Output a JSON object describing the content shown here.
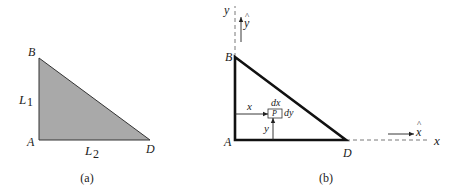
{
  "figure_a": {
    "caption": "(a)",
    "vertices": {
      "B": "B",
      "A": "A",
      "D": "D"
    },
    "side_labels": {
      "L1_main": "L",
      "L1_sub": "1",
      "L2_main": "L",
      "L2_sub": "2"
    },
    "fill_color": "#a9a9a9"
  },
  "figure_b": {
    "caption": "(b)",
    "vertices": {
      "B": "B",
      "A": "A",
      "D": "D"
    },
    "axes": {
      "y": "y",
      "x": "x",
      "y_hat": "y",
      "x_hat": "x",
      "hat": "^"
    },
    "element": {
      "point": "P",
      "dx": "dx",
      "dy": "dy",
      "x_dist": "x",
      "y_dist": "y"
    },
    "stroke_color": "#111111"
  }
}
